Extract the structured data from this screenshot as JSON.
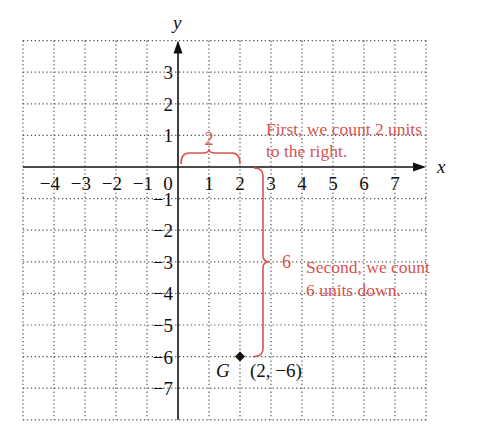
{
  "chart_data": {
    "type": "scatter",
    "title": "",
    "xlabel": "x",
    "ylabel": "y",
    "xlim": [
      -5,
      8
    ],
    "ylim": [
      -8,
      4
    ],
    "grid": true,
    "grid_style": "dotted",
    "x_ticks": [
      -4,
      -3,
      -2,
      -1,
      0,
      1,
      2,
      3,
      4,
      5,
      6,
      7
    ],
    "x_tick_labels": [
      "−4",
      "−3",
      "−2",
      "−1",
      "0",
      "1",
      "2",
      "3",
      "4",
      "5",
      "6",
      "7"
    ],
    "y_ticks": [
      3,
      2,
      1,
      -1,
      -2,
      -3,
      -4,
      -5,
      -6,
      -7
    ],
    "y_tick_labels": [
      "3",
      "2",
      "1",
      "−1",
      "−2",
      "−3",
      "−4",
      "−5",
      "−6",
      "−7"
    ],
    "points": [
      {
        "name": "G",
        "x": 2,
        "y": -6,
        "label": "G",
        "coord_label": "(2, −6)"
      }
    ],
    "annotations": [
      {
        "type": "brace-horizontal",
        "from": [
          0,
          0
        ],
        "to": [
          2,
          0
        ],
        "label": "2",
        "text": [
          "First, we count 2 units",
          "to the right."
        ]
      },
      {
        "type": "brace-vertical",
        "from": [
          2,
          0
        ],
        "to": [
          2,
          -6
        ],
        "label": "6",
        "text": [
          "Second, we count",
          "6 units down."
        ]
      }
    ]
  },
  "colors": {
    "axis": "#111111",
    "grid": "#555555",
    "annotation": "#d9534f",
    "point": "#111111"
  },
  "labels": {
    "x_axis": "x",
    "y_axis": "y",
    "zero": "0",
    "brace_h_value": "2",
    "brace_v_value": "6",
    "note1_line1": "First, we count 2 units",
    "note1_line2": "to the right.",
    "note2_line1": "Second, we count",
    "note2_line2": "6 units down.",
    "point_name": "G",
    "point_coords": "(2, −6)"
  }
}
